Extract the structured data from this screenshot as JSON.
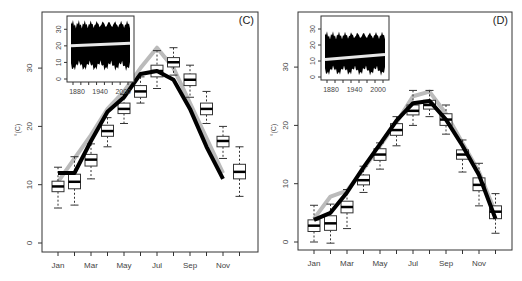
{
  "chart_data": [
    {
      "type": "box",
      "panel_label": "(C)",
      "title": "",
      "xlabel": "",
      "ylabel": "°(C)",
      "ylim": [
        -1,
        38
      ],
      "yticks": [
        0,
        10,
        20,
        30
      ],
      "categories": [
        "Jan",
        "Feb",
        "Mar",
        "Apr",
        "May",
        "Jun",
        "Jul",
        "Aug",
        "Sep",
        "Oct",
        "Nov",
        "Dec"
      ],
      "xtick_labels": [
        "Jan",
        "Mar",
        "May",
        "Jul",
        "Sep",
        "Nov"
      ],
      "boxes": {
        "median": [
          9.7,
          10.5,
          14.3,
          19.2,
          23.0,
          26.0,
          29.5,
          31.0,
          28.0,
          23.0,
          17.5,
          12.2
        ],
        "q1": [
          8.8,
          9.3,
          13.2,
          18.3,
          22.2,
          25.0,
          28.5,
          30.2,
          27.0,
          22.0,
          16.5,
          11.0
        ],
        "q3": [
          10.6,
          11.8,
          15.2,
          20.2,
          24.0,
          27.0,
          30.5,
          31.8,
          29.0,
          24.0,
          18.3,
          13.5
        ],
        "whisker_low": [
          6.0,
          6.5,
          11.0,
          16.5,
          20.5,
          24.0,
          26.5,
          28.8,
          25.0,
          20.5,
          14.5,
          8.0
        ],
        "whisker_high": [
          13.0,
          14.8,
          17.0,
          21.5,
          25.5,
          28.5,
          33.0,
          33.5,
          30.5,
          26.0,
          20.0,
          16.5
        ]
      },
      "series": [
        {
          "name": "black-line",
          "color": "#000000",
          "values": [
            12.0,
            12.0,
            17.5,
            22.5,
            25.0,
            29.0,
            29.5,
            28.0,
            23.0,
            16.5,
            11.0
          ]
        },
        {
          "name": "gray-line",
          "color": "#bbbbbb",
          "values": [
            10.5,
            14.5,
            18.5,
            23.0,
            26.0,
            30.0,
            33.5,
            30.0,
            24.0,
            18.0,
            12.0
          ]
        }
      ],
      "series_x_index": [
        [
          0,
          1,
          2,
          3,
          4,
          5,
          6,
          7,
          8,
          9,
          10,
          11
        ],
        [
          0,
          1,
          2,
          3,
          4,
          5,
          6,
          7,
          8,
          9,
          10,
          11
        ]
      ],
      "inset": {
        "type": "area",
        "xticks": [
          "1880",
          "1940",
          "2000"
        ],
        "yticks": [
          0,
          10,
          20,
          30
        ],
        "band_low": [
          5,
          17
        ],
        "band_high": [
          23,
          33
        ],
        "trend_start": 20,
        "trend_end": 21.5
      }
    },
    {
      "type": "box",
      "panel_label": "(D)",
      "title": "",
      "xlabel": "",
      "ylabel": "°(C)",
      "ylim": [
        -1,
        38
      ],
      "yticks": [
        0,
        10,
        20,
        30
      ],
      "categories": [
        "Jan",
        "Feb",
        "Mar",
        "Apr",
        "May",
        "Jun",
        "Jul",
        "Aug",
        "Sep",
        "Oct",
        "Nov",
        "Dec"
      ],
      "xtick_labels": [
        "Jan",
        "Mar",
        "May",
        "Jul",
        "Sep",
        "Nov"
      ],
      "boxes": {
        "median": [
          2.8,
          3.2,
          6.0,
          10.6,
          15.0,
          19.2,
          22.5,
          23.5,
          21.0,
          15.0,
          9.8,
          5.2
        ],
        "q1": [
          1.8,
          2.0,
          5.0,
          9.8,
          14.0,
          18.3,
          21.8,
          22.8,
          20.0,
          14.2,
          8.8,
          4.0
        ],
        "q3": [
          3.8,
          4.5,
          7.0,
          11.5,
          16.0,
          20.3,
          23.5,
          24.3,
          22.0,
          15.8,
          11.0,
          6.2
        ],
        "whisker_low": [
          0.0,
          -0.2,
          2.3,
          8.5,
          12.5,
          16.5,
          20.0,
          21.5,
          18.5,
          12.0,
          6.2,
          1.5
        ],
        "whisker_high": [
          6.3,
          6.5,
          9.0,
          13.0,
          17.0,
          21.5,
          26.0,
          26.0,
          23.5,
          17.5,
          13.5,
          8.3
        ]
      },
      "series": [
        {
          "name": "black-line",
          "color": "#000000",
          "values": [
            3.8,
            5.0,
            8.5,
            12.8,
            16.8,
            20.8,
            23.8,
            24.2,
            21.0,
            16.5,
            11.5,
            4.0
          ]
        },
        {
          "name": "gray-line",
          "color": "#bbbbbb",
          "values": [
            4.0,
            7.8,
            8.8,
            12.5,
            16.5,
            20.5,
            25.0,
            25.8,
            22.0,
            17.0,
            12.0,
            5.0
          ]
        }
      ],
      "series_x_index": [
        [
          0,
          1,
          2,
          3,
          4,
          5,
          6,
          7,
          8,
          9,
          10,
          11
        ],
        [
          0,
          1,
          2,
          3,
          4,
          5,
          6,
          7,
          8,
          9,
          10,
          11
        ]
      ],
      "inset": {
        "type": "area",
        "xticks": [
          "1880",
          "1940",
          "2000"
        ],
        "yticks": [
          0,
          10,
          20,
          30
        ],
        "band_low": [
          1,
          13
        ],
        "band_high": [
          10,
          26
        ],
        "trend_start": 11,
        "trend_end": 14
      }
    }
  ]
}
